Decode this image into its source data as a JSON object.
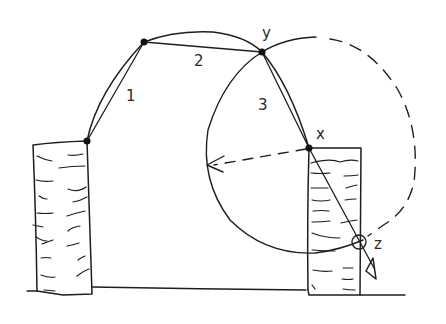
{
  "diagram": {
    "type": "hand-drawn geometric sketch",
    "ink_color": "#1e1e1e",
    "background": "#ffffff",
    "labels": {
      "segment_1": "1",
      "segment_2": "2",
      "segment_3": "3",
      "point_y": "y",
      "point_x": "x",
      "point_z": "z"
    },
    "elements": [
      {
        "name": "left-pillar",
        "kind": "hatched rectangle"
      },
      {
        "name": "right-pillar",
        "kind": "hatched rectangle"
      },
      {
        "name": "arch-curve",
        "kind": "curved line"
      },
      {
        "name": "chord-1",
        "kind": "segment",
        "label": "1"
      },
      {
        "name": "chord-2",
        "kind": "segment",
        "label": "2"
      },
      {
        "name": "chord-3",
        "kind": "segment",
        "label": "3"
      },
      {
        "name": "circle",
        "kind": "circle centered at x through y, solid left half, dashed right half"
      },
      {
        "name": "radius-arrow",
        "kind": "dashed arrow from x pointing left"
      },
      {
        "name": "extension-line",
        "kind": "line from y through x to z ending in arrowhead"
      },
      {
        "name": "point-z-marker",
        "kind": "small circle at z"
      },
      {
        "name": "ground-line",
        "kind": "horizontal line"
      }
    ]
  }
}
